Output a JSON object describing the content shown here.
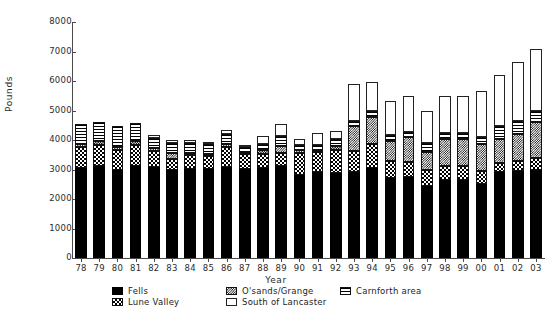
{
  "chart_data": {
    "type": "bar",
    "subtype": "stacked-bar",
    "title": "",
    "xlabel": "Year",
    "ylabel": "Pounds",
    "ylim": [
      0,
      8000
    ],
    "ytick_values": [
      0,
      1000,
      2000,
      3000,
      4000,
      5000,
      6000,
      7000,
      8000
    ],
    "ytick_labels": [
      "0",
      "1000",
      "2000",
      "3000",
      "4000",
      "5000",
      "6000",
      "7000",
      "8000"
    ],
    "grid": false,
    "legend_position": "bottom",
    "categories": [
      "78",
      "79",
      "80",
      "81",
      "82",
      "83",
      "84",
      "85",
      "86",
      "87",
      "88",
      "89",
      "90",
      "91",
      "92",
      "93",
      "94",
      "95",
      "96",
      "97",
      "98",
      "99",
      "00",
      "01",
      "02",
      "03"
    ],
    "series": [
      {
        "name": "Fells",
        "pattern": "solid-black",
        "values": [
          3050,
          3120,
          3000,
          3130,
          3090,
          3000,
          3010,
          3030,
          3090,
          3010,
          3060,
          3130,
          2830,
          2900,
          2890,
          2900,
          3060,
          2720,
          2760,
          2450,
          2650,
          2640,
          2520,
          2900,
          2950,
          3000
        ]
      },
      {
        "name": "Lune Valley",
        "pattern": "checker",
        "values": [
          700,
          720,
          670,
          690,
          530,
          350,
          480,
          420,
          660,
          510,
          480,
          440,
          740,
          680,
          780,
          740,
          820,
          560,
          490,
          520,
          480,
          490,
          430,
          330,
          350,
          400
        ]
      },
      {
        "name": "O'sands/Grange",
        "pattern": "dense-checker",
        "values": [
          120,
          130,
          110,
          160,
          110,
          210,
          50,
          90,
          130,
          80,
          130,
          230,
          90,
          80,
          130,
          820,
          900,
          700,
          850,
          620,
          890,
          900,
          900,
          800,
          900,
          1200
        ]
      },
      {
        "name": "Carnforth area",
        "pattern": "horizontal-lines",
        "values": [
          660,
          650,
          700,
          600,
          350,
          340,
          330,
          310,
          340,
          180,
          200,
          350,
          180,
          170,
          220,
          200,
          190,
          180,
          170,
          300,
          230,
          200,
          250,
          460,
          450,
          370
        ]
      },
      {
        "name": "South of Lancaster",
        "pattern": "white",
        "values": [
          0,
          0,
          0,
          0,
          100,
          110,
          130,
          60,
          130,
          20,
          270,
          400,
          190,
          410,
          300,
          1240,
          1000,
          1180,
          1220,
          1110,
          1250,
          1270,
          1570,
          1710,
          2000,
          2120
        ]
      }
    ]
  },
  "legend": {
    "items": [
      {
        "label": "Fells",
        "pattern": "solid-black"
      },
      {
        "label": "Lune Valley",
        "pattern": "checker"
      },
      {
        "label": "O'sands/Grange",
        "pattern": "dense-checker"
      },
      {
        "label": "South of Lancaster",
        "pattern": "white"
      },
      {
        "label": "Carnforth area",
        "pattern": "horizontal-lines"
      }
    ]
  }
}
